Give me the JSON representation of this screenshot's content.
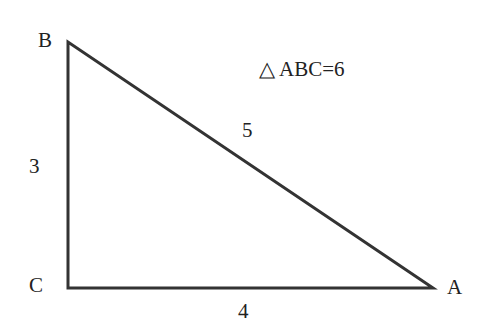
{
  "diagram": {
    "type": "right-triangle",
    "vertices": {
      "A": "A",
      "B": "B",
      "C": "C"
    },
    "sides": {
      "BC": "3",
      "CA": "4",
      "AB": "5"
    },
    "area_label": "ABC=6",
    "area_symbol": "△",
    "stroke_color": "#333333"
  }
}
